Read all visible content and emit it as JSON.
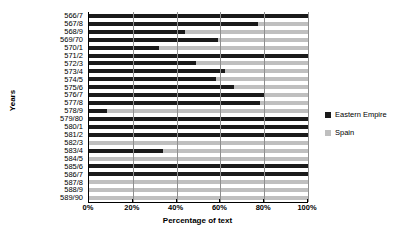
{
  "chart_data": {
    "type": "bar",
    "orientation": "horizontal",
    "stacked": true,
    "title": "",
    "xlabel": "Percentage of text",
    "ylabel": "Years",
    "xlim": [
      0,
      100
    ],
    "xticks": [
      "0%",
      "20%",
      "40%",
      "60%",
      "80%",
      "100%"
    ],
    "xtick_values": [
      0,
      20,
      40,
      60,
      80,
      100
    ],
    "grid": true,
    "legend_position": "right",
    "categories": [
      "566/7",
      "567/8",
      "568/9",
      "569/70",
      "570/1",
      "571/2",
      "572/3",
      "573/4",
      "574/5",
      "575/6",
      "576/7",
      "577/8",
      "578/9",
      "579/80",
      "580/1",
      "581/2",
      "582/3",
      "583/4",
      "584/5",
      "585/6",
      "586/7",
      "587/8",
      "588/9",
      "589/90"
    ],
    "series": [
      {
        "name": "Eastern Empire",
        "color": "#1a1a1a",
        "values": [
          100,
          77,
          44,
          59,
          32,
          100,
          49,
          62,
          58,
          66,
          80,
          78,
          8,
          100,
          100,
          100,
          0,
          34,
          0,
          100,
          100,
          0,
          0,
          0
        ]
      },
      {
        "name": "Spain",
        "color": "#bfbfbf",
        "values": [
          0,
          23,
          56,
          41,
          68,
          0,
          51,
          38,
          42,
          34,
          20,
          22,
          92,
          0,
          0,
          0,
          100,
          66,
          100,
          0,
          0,
          100,
          100,
          100
        ]
      }
    ],
    "rows": [
      {
        "year": "566/7",
        "eastern_empire": 100,
        "spain": 0
      },
      {
        "year": "567/8",
        "eastern_empire": 77,
        "spain": 23
      },
      {
        "year": "568/9",
        "eastern_empire": 44,
        "spain": 56
      },
      {
        "year": "569/70",
        "eastern_empire": 59,
        "spain": 41
      },
      {
        "year": "570/1",
        "eastern_empire": 32,
        "spain": 68
      },
      {
        "year": "571/2",
        "eastern_empire": 100,
        "spain": 0
      },
      {
        "year": "572/3",
        "eastern_empire": 49,
        "spain": 51
      },
      {
        "year": "573/4",
        "eastern_empire": 62,
        "spain": 38
      },
      {
        "year": "574/5",
        "eastern_empire": 58,
        "spain": 42
      },
      {
        "year": "575/6",
        "eastern_empire": 66,
        "spain": 34
      },
      {
        "year": "576/7",
        "eastern_empire": 80,
        "spain": 20
      },
      {
        "year": "577/8",
        "eastern_empire": 78,
        "spain": 22
      },
      {
        "year": "578/9",
        "eastern_empire": 8,
        "spain": 92
      },
      {
        "year": "579/80",
        "eastern_empire": 100,
        "spain": 0
      },
      {
        "year": "580/1",
        "eastern_empire": 100,
        "spain": 0
      },
      {
        "year": "581/2",
        "eastern_empire": 100,
        "spain": 0
      },
      {
        "year": "582/3",
        "eastern_empire": 0,
        "spain": 100
      },
      {
        "year": "583/4",
        "eastern_empire": 34,
        "spain": 66
      },
      {
        "year": "584/5",
        "eastern_empire": 0,
        "spain": 100
      },
      {
        "year": "585/6",
        "eastern_empire": 100,
        "spain": 0
      },
      {
        "year": "586/7",
        "eastern_empire": 100,
        "spain": 0
      },
      {
        "year": "587/8",
        "eastern_empire": 0,
        "spain": 100
      },
      {
        "year": "588/9",
        "eastern_empire": 0,
        "spain": 100
      },
      {
        "year": "589/90",
        "eastern_empire": 0,
        "spain": 100
      }
    ]
  },
  "axes": {
    "x_title": "Percentage of text",
    "y_title": "Years"
  },
  "legend": {
    "items": [
      {
        "label": "Eastern Empire",
        "color": "#1a1a1a"
      },
      {
        "label": "Spain",
        "color": "#bfbfbf"
      }
    ]
  }
}
